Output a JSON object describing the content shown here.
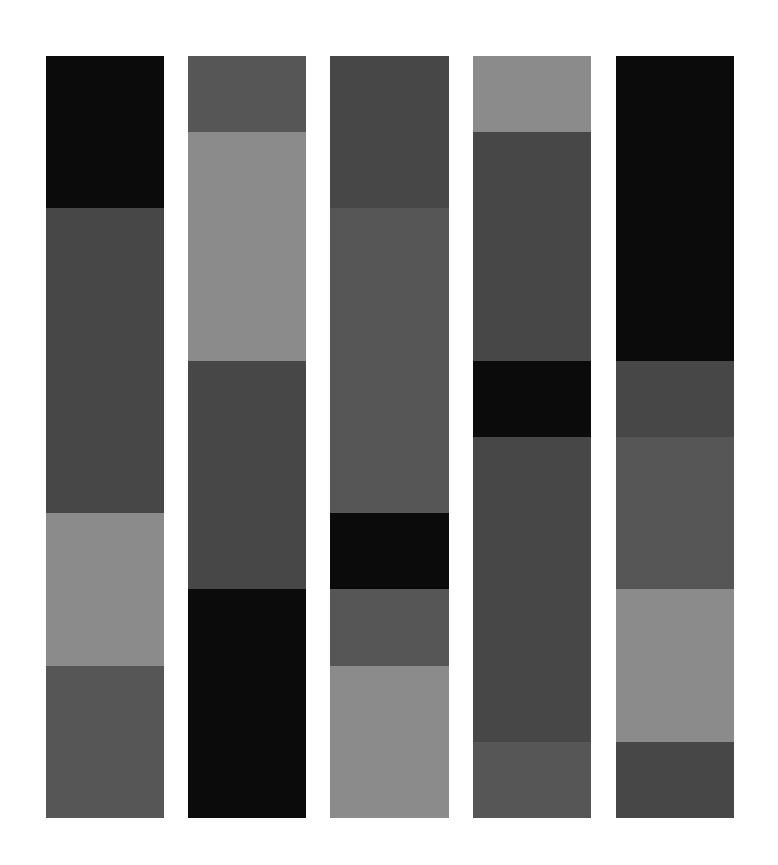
{
  "palette": {
    "black": "#0b0b0b",
    "dark": "#474747",
    "mid": "#565656",
    "light": "#8b8b8b"
  },
  "grid": {
    "top": 56,
    "unit_height": 76.2,
    "units": 10
  },
  "columns": [
    {
      "id": "column-1",
      "left": 46,
      "width": 118,
      "segments": [
        {
          "shade": "black",
          "units": 2
        },
        {
          "shade": "dark",
          "units": 4
        },
        {
          "shade": "light",
          "units": 2
        },
        {
          "shade": "mid",
          "units": 2
        }
      ]
    },
    {
      "id": "column-2",
      "left": 188,
      "width": 118,
      "segments": [
        {
          "shade": "mid",
          "units": 1
        },
        {
          "shade": "light",
          "units": 3
        },
        {
          "shade": "dark",
          "units": 3
        },
        {
          "shade": "black",
          "units": 3
        }
      ]
    },
    {
      "id": "column-3",
      "left": 330,
      "width": 119,
      "segments": [
        {
          "shade": "dark",
          "units": 2
        },
        {
          "shade": "mid",
          "units": 4
        },
        {
          "shade": "black",
          "units": 1
        },
        {
          "shade": "mid",
          "units": 1
        },
        {
          "shade": "light",
          "units": 2
        }
      ]
    },
    {
      "id": "column-4",
      "left": 473,
      "width": 118,
      "segments": [
        {
          "shade": "light",
          "units": 1
        },
        {
          "shade": "dark",
          "units": 3
        },
        {
          "shade": "black",
          "units": 1
        },
        {
          "shade": "dark",
          "units": 4
        },
        {
          "shade": "mid",
          "units": 1
        }
      ]
    },
    {
      "id": "column-5",
      "left": 616,
      "width": 118,
      "segments": [
        {
          "shade": "black",
          "units": 4
        },
        {
          "shade": "dark",
          "units": 1
        },
        {
          "shade": "mid",
          "units": 2
        },
        {
          "shade": "light",
          "units": 2
        },
        {
          "shade": "dark",
          "units": 1
        }
      ]
    }
  ]
}
